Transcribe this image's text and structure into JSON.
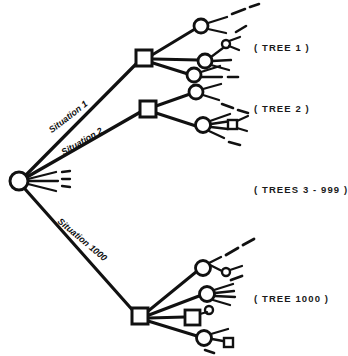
{
  "figure": {
    "title_labels": {
      "tree_1": "( TREE  1 )",
      "tree_2": "( TREE  2 )",
      "trees_middle": "( TREES 3 - 999 )",
      "tree_1000": "( TREE 1000 )"
    },
    "branch_labels": {
      "situation_1": "Situation 1",
      "situation_2": "Situation 2",
      "situation_1000": "Situation 1000"
    },
    "colors": {
      "ink": "#111111",
      "background": "#ffffff"
    },
    "structure": {
      "root": {
        "shape": "circle",
        "cx": 19,
        "cy": 181,
        "r": 9
      },
      "decision_nodes": [
        {
          "name": "tree-1-root",
          "shape": "square",
          "x": 144,
          "y": 58
        },
        {
          "name": "tree-2-root",
          "shape": "square",
          "x": 148,
          "y": 108
        },
        {
          "name": "tree-1000-root",
          "shape": "square",
          "x": 140,
          "y": 316
        }
      ],
      "tree_count": 1000
    }
  }
}
